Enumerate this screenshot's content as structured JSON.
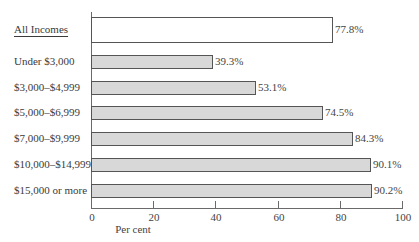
{
  "chart_data": {
    "type": "bar",
    "orientation": "horizontal",
    "title": "",
    "xlabel": "Per cent",
    "ylabel": "",
    "xlim": [
      0,
      100
    ],
    "xticks": [
      0,
      20,
      40,
      60,
      80,
      100
    ],
    "grid": false,
    "legend": null,
    "categories": [
      "All Incomes",
      "Under $3,000",
      "$3,000–$4,999",
      "$5,000–$6,999",
      "$7,000–$9,999",
      "$10,000–$14,999",
      "$15,000 or more"
    ],
    "values": [
      77.8,
      39.3,
      53.1,
      74.5,
      84.3,
      90.1,
      90.2
    ],
    "value_labels": [
      "77.8%",
      "39.3%",
      "53.1%",
      "74.5%",
      "84.3%",
      "90.1%",
      "90.2%"
    ],
    "highlight": {
      "category": "All Incomes",
      "style": "white fill, underlined label"
    }
  },
  "colors": {
    "bar_fill": "#d8d8d8",
    "total_bar_fill": "#ffffff",
    "bar_border": "#555555",
    "axis": "#6a6a6a",
    "text": "#3a3a3a"
  }
}
